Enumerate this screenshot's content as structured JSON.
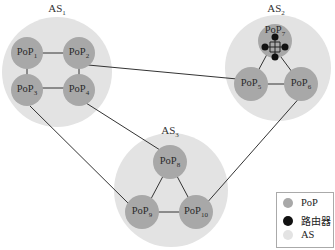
{
  "colors": {
    "as_fill": "#e3e3e3",
    "pop_fill": "#a8a8a8",
    "router_fill": "#111111",
    "link": "#333333"
  },
  "as": [
    {
      "label": "AS",
      "sub": "1"
    },
    {
      "label": "AS",
      "sub": "2"
    },
    {
      "label": "AS",
      "sub": "3"
    }
  ],
  "pops": {
    "as1": [
      {
        "label": "PoP",
        "sub": "1"
      },
      {
        "label": "PoP",
        "sub": "2"
      },
      {
        "label": "PoP",
        "sub": "3"
      },
      {
        "label": "PoP",
        "sub": "4"
      }
    ],
    "as2": [
      {
        "label": "PoP",
        "sub": "7"
      },
      {
        "label": "PoP",
        "sub": "5"
      },
      {
        "label": "PoP",
        "sub": "6"
      }
    ],
    "as3": [
      {
        "label": "PoP",
        "sub": "8"
      },
      {
        "label": "PoP",
        "sub": "9"
      },
      {
        "label": "PoP",
        "sub": "10"
      }
    ]
  },
  "legend": {
    "pop": "PoP",
    "router": "路由器",
    "as": "AS"
  }
}
